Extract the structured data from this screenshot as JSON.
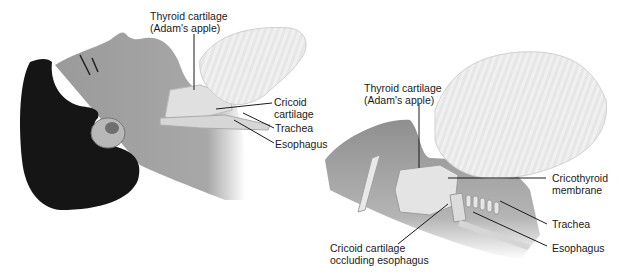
{
  "left_panel": {
    "labels": {
      "thyroid_line1": "Thyroid cartilage",
      "thyroid_line2": "(Adam's apple)",
      "cricoid_line1": "Cricoid",
      "cricoid_line2": "cartilage",
      "trachea": "Trachea",
      "esophagus": "Esophagus"
    }
  },
  "right_panel": {
    "labels": {
      "thyroid_line1": "Thyroid cartilage",
      "thyroid_line2": "(Adam's apple)",
      "cricothyroid_line1": "Cricothyroid",
      "cricothyroid_line2": "membrane",
      "trachea": "Trachea",
      "esophagus": "Esophagus",
      "cricoid_occl_line1": "Cricoid cartilage",
      "cricoid_occl_line2": "occluding esophagus"
    }
  },
  "colors": {
    "hair": "#151515",
    "skin": "#9a9a9a",
    "skin_light": "#bdbdbd",
    "hand": "#ececec",
    "hand_stroke": "#c8c8c8",
    "cartilage": "#e2e2e2",
    "line": "#1a1a1a"
  }
}
